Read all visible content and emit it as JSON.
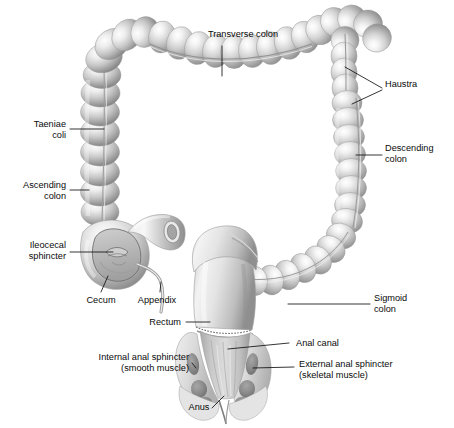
{
  "figure": {
    "background_color": "#ffffff",
    "text_color": "#0a0a0a",
    "leader_color": "#111111",
    "width": 454,
    "height": 428
  },
  "labels": [
    {
      "id": "transverse-colon",
      "text": "Transverse colon",
      "align": "center",
      "x": 243,
      "y": 34
    },
    {
      "id": "haustra",
      "text": "Haustra",
      "align": "left",
      "x": 385,
      "y": 84
    },
    {
      "id": "taeniae-coli",
      "text": "Taeniae\ncoli",
      "align": "right",
      "x": 66,
      "y": 124
    },
    {
      "id": "descending-colon",
      "text": "Descending\ncolon",
      "align": "left",
      "x": 385,
      "y": 147
    },
    {
      "id": "ascending-colon",
      "text": "Ascending\ncolon",
      "align": "right",
      "x": 66,
      "y": 185
    },
    {
      "id": "ileocecal-sphincter",
      "text": "Ileocecal\nsphincter",
      "align": "right",
      "x": 66,
      "y": 243
    },
    {
      "id": "cecum",
      "text": "Cecum",
      "align": "center",
      "x": 101,
      "y": 300
    },
    {
      "id": "appendix",
      "text": "Appendix",
      "align": "center",
      "x": 157,
      "y": 300
    },
    {
      "id": "sigmoid-colon",
      "text": "Sigmoid\ncolon",
      "align": "left",
      "x": 374,
      "y": 298
    },
    {
      "id": "rectum",
      "text": "Rectum",
      "align": "right",
      "x": 181,
      "y": 318
    },
    {
      "id": "anal-canal",
      "text": "Anal canal",
      "align": "left",
      "x": 293,
      "y": 338
    },
    {
      "id": "internal-anal-sphincter",
      "text": "Internal anal sphincter\n(smooth muscle)",
      "align": "right",
      "x": 189,
      "y": 352
    },
    {
      "id": "external-anal-sphincter",
      "text": "External anal sphincter\n(skeletal muscle)",
      "align": "left",
      "x": 298,
      "y": 359
    },
    {
      "id": "anus",
      "text": "Anus",
      "align": "center",
      "x": 199,
      "y": 404
    }
  ],
  "structures": [
    {
      "id": "transverse-colon",
      "name": "Transverse colon"
    },
    {
      "id": "haustra",
      "name": "Haustra"
    },
    {
      "id": "taeniae-coli",
      "name": "Taeniae coli"
    },
    {
      "id": "descending-colon",
      "name": "Descending colon"
    },
    {
      "id": "ascending-colon",
      "name": "Ascending colon"
    },
    {
      "id": "ileocecal-sphincter",
      "name": "Ileocecal sphincter"
    },
    {
      "id": "cecum",
      "name": "Cecum"
    },
    {
      "id": "appendix",
      "name": "Appendix"
    },
    {
      "id": "sigmoid-colon",
      "name": "Sigmoid colon"
    },
    {
      "id": "rectum",
      "name": "Rectum"
    },
    {
      "id": "anal-canal",
      "name": "Anal canal"
    },
    {
      "id": "internal-anal-sphincter",
      "name": "Internal anal sphincter"
    },
    {
      "id": "external-anal-sphincter",
      "name": "External anal sphincter"
    },
    {
      "id": "anus",
      "name": "Anus"
    },
    {
      "id": "ileum",
      "name": "Ileum"
    }
  ],
  "palette": {
    "tissue_light": "#f4f4f4",
    "tissue_mid": "#c9c9c9",
    "tissue_dark": "#8e8e8e",
    "tissue_shadow": "#6e6e6e",
    "outline": "#9a9a9a",
    "lumen": "#b6b6b6",
    "muscle": "#808080"
  }
}
